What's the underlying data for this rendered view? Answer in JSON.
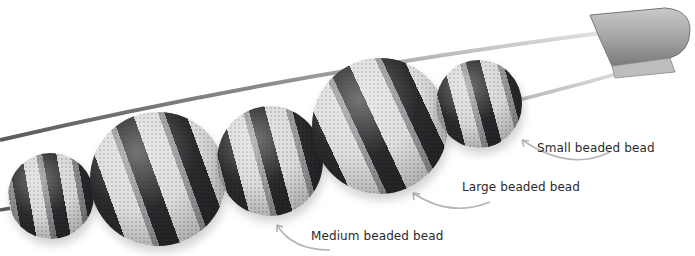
{
  "image": {
    "description": "Beaded beads threaded on a large safety pin",
    "labels": {
      "small": "Small beaded bead",
      "large": "Large beaded bead",
      "medium": "Medium beaded bead"
    },
    "colors": {
      "dark_bead": "#2b2b2e",
      "light_bead": "#d9d9d9",
      "pin_metal": "#9a9a9a",
      "arrow": "#b5b5b5",
      "text": "#2a2a2a",
      "background": "#ffffff"
    }
  }
}
